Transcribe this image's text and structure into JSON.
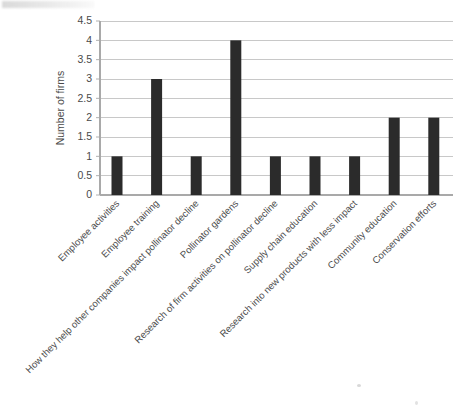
{
  "chart_data": {
    "type": "bar",
    "title": "",
    "subtitle": "",
    "xlabel": "",
    "ylabel": "Number of firms",
    "ylim": [
      0,
      4.5
    ],
    "ytick_values": [
      0,
      0.5,
      1,
      1.5,
      2,
      2.5,
      3,
      3.5,
      4,
      4.5
    ],
    "ytick_labels": [
      "0",
      "0.5",
      "1",
      "1.5",
      "2",
      "2.5",
      "3",
      "3.5",
      "4",
      "4.5"
    ],
    "grid": "horizontal",
    "legend": "none",
    "bar_color": "#2b2b2b",
    "gridline_color": "#c8c8c8",
    "categories": [
      "Employee activities",
      "Employee training",
      "How they help other companies impact pollinator decline",
      "Pollinator gardens",
      "Research of firm activities on pollinator decline",
      "Supply chain education",
      "Research into new products with less impact",
      "Community education",
      "Conservation efforts"
    ],
    "values": [
      1,
      3,
      1,
      4,
      1,
      1,
      1,
      2,
      2
    ],
    "annotations": []
  },
  "figure": {
    "background_color": "#ffffff",
    "xtick_rotation_degrees": -45
  }
}
